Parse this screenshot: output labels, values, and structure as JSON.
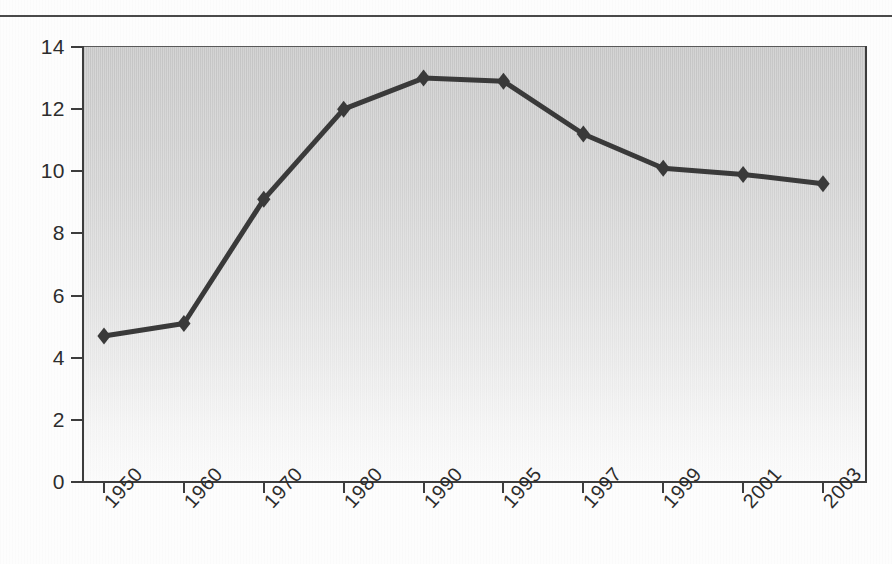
{
  "figure": {
    "top_rule": "horizontal-rule",
    "line_color": "#3a3a3a",
    "marker_color": "#3a3a3a",
    "plot_bg_top": "#c6c6c6",
    "plot_bg_bottom": "#fbfbfb",
    "axis_color": "#3d3d3d"
  },
  "chart_data": {
    "type": "line",
    "title": "",
    "subtitle": "",
    "xlabel": "",
    "ylabel": "",
    "categories": [
      "1950",
      "1960",
      "1970",
      "1980",
      "1990",
      "1995",
      "1997",
      "1999",
      "2001",
      "2003"
    ],
    "values": [
      4.7,
      5.1,
      9.1,
      12.0,
      13.0,
      12.9,
      11.2,
      10.1,
      9.9,
      9.6
    ],
    "series": [
      {
        "name": "series-1",
        "values": [
          4.7,
          5.1,
          9.1,
          12.0,
          13.0,
          12.9,
          11.2,
          10.1,
          9.9,
          9.6
        ]
      }
    ],
    "ylim": [
      0,
      14
    ],
    "ytick_labels": [
      "14",
      "12",
      "10",
      "8",
      "6",
      "4",
      "2",
      "0"
    ],
    "ytick_values": [
      14,
      12,
      10,
      8,
      6,
      4,
      2,
      0
    ],
    "xtick_labels": [
      "1950",
      "1960",
      "1970",
      "1980",
      "1990",
      "1995",
      "1997",
      "1999",
      "2001",
      "2003"
    ],
    "xtick_rotation": -48,
    "grid": false,
    "legend": null,
    "legend_position": "none",
    "marker": "diamond",
    "annotations": []
  },
  "axis": {
    "y": {
      "ticks": [
        {
          "label": "14",
          "value": 14
        },
        {
          "label": "12",
          "value": 12
        },
        {
          "label": "10",
          "value": 10
        },
        {
          "label": "8",
          "value": 8
        },
        {
          "label": "6",
          "value": 6
        },
        {
          "label": "4",
          "value": 4
        },
        {
          "label": "2",
          "value": 2
        },
        {
          "label": "0",
          "value": 0
        }
      ]
    },
    "x": {
      "ticks": [
        {
          "label": "1950"
        },
        {
          "label": "1960"
        },
        {
          "label": "1970"
        },
        {
          "label": "1980"
        },
        {
          "label": "1990"
        },
        {
          "label": "1995"
        },
        {
          "label": "1997"
        },
        {
          "label": "1999"
        },
        {
          "label": "2001"
        },
        {
          "label": "2003"
        }
      ]
    }
  }
}
